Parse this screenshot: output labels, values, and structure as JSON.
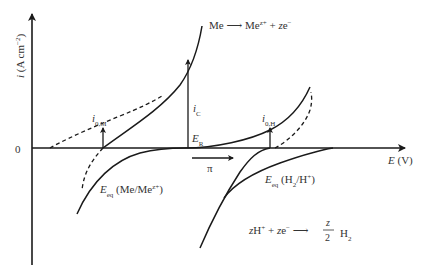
{
  "diagram": {
    "type": "polarization-diagram",
    "axes": {
      "y_label": "i (A cm⁻²)",
      "x_label": "E (V)",
      "origin_label": "0"
    },
    "labels": {
      "anodic_reaction": "Me ⟶ Me^{z+} + ze⁻",
      "cathodic_reaction": "zH⁺ + ze⁻ ⟶ (z/2) H₂",
      "i0M": "i0,M",
      "i0H": "i0,H",
      "iC": "iC",
      "ER": "ER",
      "pi": "π",
      "eq_me": "Eeq (Me/Me^{z+})",
      "eq_h": "Eeq (H₂/H⁺)"
    },
    "colors": {
      "line": "#1a1a1a",
      "text": "#333333",
      "background": "#ffffff"
    }
  }
}
